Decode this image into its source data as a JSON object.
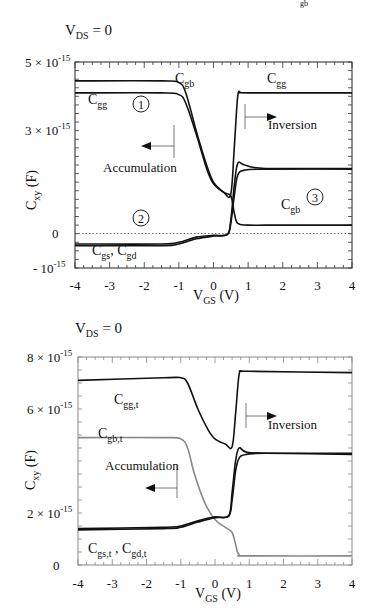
{
  "corner_mark": "gb",
  "chart_data": [
    {
      "type": "line",
      "title": "V_DS = 0",
      "title_main": "V",
      "title_sub": "DS",
      "title_rest": " = 0",
      "xlabel": "V_GS (V)",
      "xlabel_main": "V",
      "xlabel_sub": "GS",
      "xlabel_rest": " (V)",
      "ylabel": "C_xy (F)",
      "ylabel_main": "C",
      "ylabel_sub": "xy",
      "ylabel_rest": " (F)",
      "xlim": [
        -4,
        4
      ],
      "ylim": [
        -1e-15,
        5e-15
      ],
      "xticks": [
        "-4",
        "-3",
        "-2",
        "-1",
        "0",
        "1",
        "2",
        "3",
        "4"
      ],
      "yticks": [
        {
          "value": 5e-15,
          "label": "5 × 10",
          "exp": "-15"
        },
        {
          "value": 3e-15,
          "label": "3 × 10",
          "exp": "-15"
        },
        {
          "value": 0,
          "label": "0",
          "exp": ""
        },
        {
          "value": -1e-15,
          "label": "- 10",
          "exp": "-15"
        }
      ],
      "zero_line": "dotted",
      "series": [
        {
          "name": "C_gb",
          "x": [
            -4,
            -1.5,
            -1.0,
            -0.8,
            -0.5,
            -0.2,
            0.0,
            0.3,
            0.5,
            0.6,
            0.7,
            1.0,
            2.0,
            4.0
          ],
          "y": [
            4.45e-15,
            4.45e-15,
            4.4e-15,
            4.1e-15,
            3e-15,
            2e-15,
            1.5e-15,
            1.2e-15,
            1.1e-15,
            6e-16,
            3e-16,
            2.5e-16,
            2.5e-16,
            2.5e-16
          ]
        },
        {
          "name": "C_gg",
          "x": [
            -4,
            -1.5,
            -1.0,
            -0.8,
            -0.5,
            -0.2,
            0.0,
            0.3,
            0.5,
            0.6,
            0.7,
            0.8,
            1.0,
            4.0
          ],
          "y": [
            4.1e-15,
            4.1e-15,
            4.05e-15,
            3.8e-15,
            2.9e-15,
            1.9e-15,
            1.45e-15,
            1.2e-15,
            1.15e-15,
            2.5e-15,
            4e-15,
            4.1e-15,
            4.1e-15,
            4.1e-15
          ]
        },
        {
          "name": "C_gs",
          "x": [
            -4,
            -1.5,
            -1.0,
            -0.5,
            0.0,
            0.4,
            0.5,
            0.6,
            0.7,
            0.9,
            1.5,
            4.0
          ],
          "y": [
            -3e-16,
            -3e-16,
            -2.5e-16,
            -1e-16,
            -5e-17,
            -2e-17,
            4e-16,
            1.4e-15,
            2.05e-15,
            2e-15,
            1.9e-15,
            1.9e-15
          ]
        },
        {
          "name": "C_gd",
          "x": [
            -4,
            -1.5,
            -1.0,
            -0.5,
            0.0,
            0.4,
            0.5,
            0.6,
            0.7,
            0.9,
            1.5,
            4.0
          ],
          "y": [
            -3.5e-16,
            -3.5e-16,
            -3e-16,
            -1.5e-16,
            -7e-17,
            -3e-17,
            3e-16,
            1.1e-15,
            1.7e-15,
            1.85e-15,
            1.88e-15,
            1.88e-15
          ]
        }
      ],
      "annotations": [
        {
          "text": "C_gb",
          "main": "C",
          "sub": "gb",
          "position": "near x=-1, top"
        },
        {
          "text": "C_gg",
          "main": "C",
          "sub": "gg",
          "position": "left plateau"
        },
        {
          "text": "C_gg",
          "main": "C",
          "sub": "gg",
          "position": "right plateau"
        },
        {
          "text": "1",
          "type": "circled",
          "position": "x=-1.8, y=3.9e-15"
        },
        {
          "text": "2",
          "type": "circled",
          "position": "x=-1.8, y=0.3e-15"
        },
        {
          "text": "3",
          "type": "circled",
          "position": "x=3.0, y=0.8e-15"
        },
        {
          "text": "C_gb",
          "main": "C",
          "sub": "gb",
          "position": "right lower"
        },
        {
          "text": "C_gs, C_gd",
          "main1": "C",
          "sub1": "gs",
          "main2": "C",
          "sub2": "gd",
          "position": "bottom left"
        },
        {
          "text": "Accumulation",
          "arrow": "left",
          "position": "x=-1.2"
        },
        {
          "text": "Inversion",
          "arrow": "right",
          "position": "x=0.8"
        }
      ]
    },
    {
      "type": "line",
      "title": "V_DS = 0",
      "title_main": "V",
      "title_sub": "DS",
      "title_rest": " = 0",
      "xlabel": "V_GS (V)",
      "xlabel_main": "V",
      "xlabel_sub": "GS",
      "xlabel_rest": " (V)",
      "ylabel": "C_xy (F)",
      "ylabel_main": "C",
      "ylabel_sub": "xy",
      "ylabel_rest": " (F)",
      "xlim": [
        -4,
        4
      ],
      "ylim": [
        0,
        8e-15
      ],
      "xticks": [
        "-4",
        "-3",
        "-2",
        "-1",
        "0",
        "1",
        "2",
        "3",
        "4"
      ],
      "yticks": [
        {
          "value": 8e-15,
          "label": "8 × 10",
          "exp": "-15"
        },
        {
          "value": 6e-15,
          "label": "6 × 10",
          "exp": "-15"
        },
        {
          "value": 2e-15,
          "label": "2 × 10",
          "exp": "-15"
        },
        {
          "value": 0,
          "label": "0",
          "exp": ""
        }
      ],
      "series": [
        {
          "name": "C_gg,t",
          "color": "#111111",
          "x": [
            -4,
            -1.5,
            -1.0,
            -0.8,
            -0.5,
            -0.2,
            0.0,
            0.3,
            0.5,
            0.6,
            0.7,
            0.8,
            1.0,
            4.0
          ],
          "y": [
            7.1e-15,
            7.2e-15,
            7.2e-15,
            7e-15,
            6e-15,
            5.2e-15,
            4.85e-15,
            4.65e-15,
            4.55e-15,
            5.8e-15,
            7.3e-15,
            7.45e-15,
            7.45e-15,
            7.4e-15
          ]
        },
        {
          "name": "C_gb,t",
          "color": "#888888",
          "x": [
            -4,
            -1.5,
            -1.0,
            -0.8,
            -0.6,
            -0.3,
            0.0,
            0.3,
            0.5,
            0.6,
            0.7,
            1.0,
            4.0
          ],
          "y": [
            4.9e-15,
            4.9e-15,
            4.85e-15,
            4.5e-15,
            3.5e-15,
            2.4e-15,
            1.75e-15,
            1.45e-15,
            1.25e-15,
            8e-16,
            4e-16,
            3.5e-16,
            3.5e-16
          ]
        },
        {
          "name": "C_gs,t",
          "color": "#111111",
          "x": [
            -4,
            -1.5,
            -1.0,
            -0.5,
            0.0,
            0.4,
            0.5,
            0.6,
            0.7,
            0.9,
            1.5,
            4.0
          ],
          "y": [
            1.4e-15,
            1.45e-15,
            1.5e-15,
            1.7e-15,
            1.85e-15,
            1.9e-15,
            2.8e-15,
            4e-15,
            4.5e-15,
            4.35e-15,
            4.3e-15,
            4.3e-15
          ]
        },
        {
          "name": "C_gd,t",
          "color": "#111111",
          "x": [
            -4,
            -1.5,
            -1.0,
            -0.5,
            0.0,
            0.4,
            0.5,
            0.6,
            0.7,
            0.9,
            1.5,
            4.0
          ],
          "y": [
            1.35e-15,
            1.4e-15,
            1.45e-15,
            1.65e-15,
            1.82e-15,
            1.88e-15,
            2.5e-15,
            3.6e-15,
            4.1e-15,
            4.25e-15,
            4.3e-15,
            4.25e-15
          ]
        }
      ],
      "annotations": [
        {
          "text": "C_gg,t",
          "main": "C",
          "sub": "gg,t",
          "position": "left"
        },
        {
          "text": "C_gb,t",
          "main": "C",
          "sub": "gb,t",
          "position": "left, above gray plateau"
        },
        {
          "text": "C_gs,t , C_gd,t",
          "main1": "C",
          "sub1": "gs,t",
          "main2": "C",
          "sub2": "gd,t",
          "position": "bottom left"
        },
        {
          "text": "Accumulation",
          "arrow": "left",
          "position": "x=-1.1"
        },
        {
          "text": "Inversion",
          "arrow": "right",
          "position": "x=0.8"
        }
      ]
    }
  ]
}
